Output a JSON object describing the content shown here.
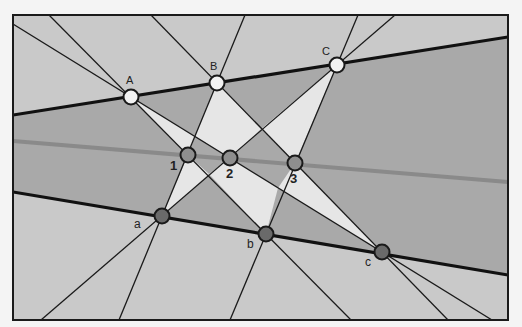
{
  "diagram": {
    "colors": {
      "background": "#f4f4f4",
      "outer_region": "#c9c9c9",
      "band_region": "#a9a9a9",
      "light_region": "#e6e6e6",
      "frame": "#1a1a1a",
      "pappus_line": "#8a8a8a",
      "upper_point_fill": "#f2f2f2",
      "lower_point_fill": "#6a6a6a",
      "middle_point_fill": "#8e8e8e"
    },
    "upper_points": [
      {
        "label": "A",
        "x": 131,
        "y": 97
      },
      {
        "label": "B",
        "x": 217,
        "y": 83
      },
      {
        "label": "C",
        "x": 337,
        "y": 65
      }
    ],
    "lower_points": [
      {
        "label": "a",
        "x": 162,
        "y": 216
      },
      {
        "label": "b",
        "x": 266,
        "y": 234
      },
      {
        "label": "c",
        "x": 382,
        "y": 252
      }
    ],
    "intersection_points": [
      {
        "label": "1",
        "x": 188,
        "y": 155
      },
      {
        "label": "2",
        "x": 230,
        "y": 158
      },
      {
        "label": "3",
        "x": 295,
        "y": 163
      }
    ]
  }
}
